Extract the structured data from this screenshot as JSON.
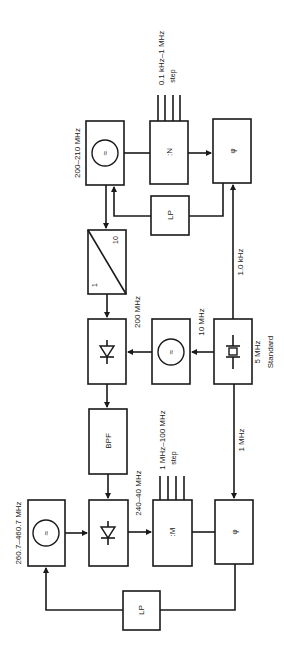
{
  "diagram": {
    "title": "",
    "orientation": "rotated-90",
    "blocks": {
      "vco_top": {
        "label": "200–210 MHz",
        "symbol": "≈"
      },
      "div_n": {
        "label": ":N",
        "input_label": "0.1 kHz–1 MHz",
        "input_sub": "step"
      },
      "phase_top": {
        "label": "φ"
      },
      "lp_top": {
        "label": "LP"
      },
      "ratio_divider": {
        "label_a": "1",
        "label_b": "10"
      },
      "mixer_top": {
        "label": "200 MHz"
      },
      "vco_mid": {
        "label": "10 MHz",
        "symbol": "≈"
      },
      "standard": {
        "label": "5 MHz",
        "sub": "Standard"
      },
      "bpf": {
        "label": "BPF"
      },
      "vco_bottom": {
        "label": "260.7–460.7 MHz",
        "symbol": "≈"
      },
      "mixer_bottom": {
        "label": "240–40 MHz"
      },
      "div_m": {
        "label": ":M",
        "input_label": "1 MHz–100 MHz",
        "input_sub": "step"
      },
      "phase_bottom": {
        "label": "φ"
      },
      "lp_bottom": {
        "label": "LP"
      }
    },
    "signals": {
      "ref_1khz": "1.0 kHz",
      "ref_1mhz": "1 MHz"
    }
  }
}
